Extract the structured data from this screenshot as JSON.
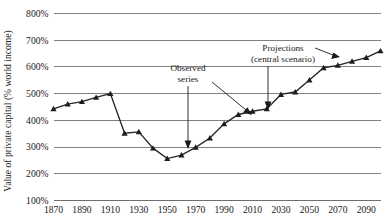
{
  "chart_data": {
    "type": "line",
    "title": "",
    "xlabel": "",
    "ylabel": "Value of private capital (% world income)",
    "xlim": [
      1870,
      2100
    ],
    "ylim": [
      100,
      800
    ],
    "ytick_labels": [
      "100%",
      "200%",
      "300%",
      "400%",
      "500%",
      "600%",
      "700%",
      "800%"
    ],
    "ytick_values": [
      100,
      200,
      300,
      400,
      500,
      600,
      700,
      800
    ],
    "xtick_labels": [
      "1870",
      "1890",
      "1910",
      "1930",
      "1950",
      "1970",
      "1990",
      "2010",
      "2030",
      "2050",
      "2070",
      "2090"
    ],
    "xtick_values": [
      1870,
      1890,
      1910,
      1930,
      1950,
      1970,
      1990,
      2010,
      2030,
      2050,
      2070,
      2090
    ],
    "grid": "horizontal",
    "legend": "none",
    "x": [
      1870,
      1880,
      1890,
      1900,
      1910,
      1920,
      1930,
      1940,
      1950,
      1960,
      1970,
      1980,
      1990,
      2000,
      2010,
      2020,
      2030,
      2040,
      2050,
      2060,
      2070,
      2080,
      2090,
      2100
    ],
    "series": [
      {
        "name": "Value of private capital (% world income)",
        "values": [
          443,
          461,
          470,
          486,
          500,
          352,
          357,
          296,
          257,
          270,
          299,
          334,
          387,
          422,
          434,
          443,
          497,
          506,
          551,
          597,
          606,
          621,
          635,
          660
        ]
      }
    ],
    "annotations": [
      {
        "id": "observed-series",
        "line1": "Observed",
        "line2": "series"
      },
      {
        "id": "projections",
        "line1": "Projections",
        "line2": "(central scenario)"
      }
    ],
    "colors": {
      "line": "#262626",
      "marker": "#1c1c1c",
      "grid": "#808080",
      "text": "#1a1a1a",
      "background": "#ffffff"
    }
  }
}
